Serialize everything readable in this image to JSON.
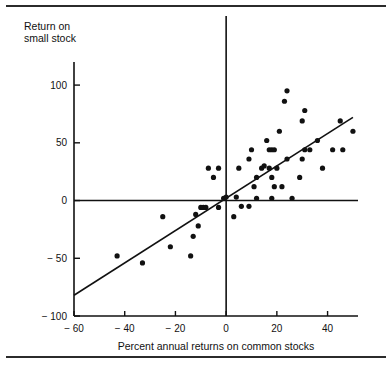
{
  "figure": {
    "top_rule": "horizontal-rule",
    "bottom_rule": "horizontal-rule"
  },
  "chart_data": {
    "type": "scatter",
    "title": "",
    "xlabel": "Percent annual returns on common stocks",
    "ylabel_line1": "Return on",
    "ylabel_line2": "small stock",
    "xlim": [
      -60,
      52
    ],
    "ylim": [
      -100,
      120
    ],
    "xticks": [
      -60,
      -40,
      -20,
      0,
      20,
      40
    ],
    "xticklabels": [
      "− 60",
      "− 40",
      "− 20",
      "0",
      "20",
      "40"
    ],
    "yticks": [
      -100,
      -50,
      0,
      50,
      100
    ],
    "yticklabels": [
      "− 100",
      "− 50",
      "0",
      "50",
      "100"
    ],
    "grid": false,
    "legend": "none",
    "zero_lines": {
      "x": 0,
      "y": 0
    },
    "trendline": {
      "type": "linear-fit",
      "slope": 1.4,
      "intercept": 2,
      "x_start": -60,
      "y_start": -82,
      "x_end": 50,
      "y_end": 72
    },
    "points": [
      [
        -43,
        -48
      ],
      [
        -33,
        -54
      ],
      [
        -25,
        -14
      ],
      [
        -22,
        -40
      ],
      [
        -14,
        -48
      ],
      [
        -13,
        -31
      ],
      [
        -11,
        -22
      ],
      [
        -12,
        -12
      ],
      [
        -10,
        -6
      ],
      [
        -9,
        -6
      ],
      [
        -8,
        -6
      ],
      [
        -7,
        28
      ],
      [
        -5,
        20
      ],
      [
        -3,
        28
      ],
      [
        -3,
        -6
      ],
      [
        -1,
        2
      ],
      [
        0,
        3
      ],
      [
        3,
        -14
      ],
      [
        4,
        3
      ],
      [
        5,
        28
      ],
      [
        6,
        -5
      ],
      [
        9,
        -5
      ],
      [
        9,
        36
      ],
      [
        10,
        44
      ],
      [
        11,
        12
      ],
      [
        12,
        20
      ],
      [
        12,
        2
      ],
      [
        14,
        28
      ],
      [
        15,
        30
      ],
      [
        16,
        52
      ],
      [
        17,
        28
      ],
      [
        17,
        44
      ],
      [
        18,
        2
      ],
      [
        18,
        20
      ],
      [
        18,
        44
      ],
      [
        19,
        12
      ],
      [
        19,
        44
      ],
      [
        20,
        28
      ],
      [
        21,
        60
      ],
      [
        22,
        12
      ],
      [
        23,
        86
      ],
      [
        24,
        95
      ],
      [
        24,
        36
      ],
      [
        26,
        2
      ],
      [
        29,
        20
      ],
      [
        30,
        69
      ],
      [
        30,
        36
      ],
      [
        31,
        78
      ],
      [
        31,
        44
      ],
      [
        33,
        44
      ],
      [
        36,
        52
      ],
      [
        38,
        28
      ],
      [
        42,
        44
      ],
      [
        45,
        69
      ],
      [
        46,
        44
      ],
      [
        50,
        60
      ]
    ]
  }
}
